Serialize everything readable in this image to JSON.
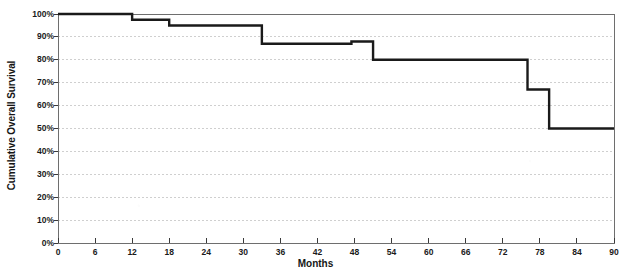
{
  "chart_data": {
    "type": "line",
    "subtype": "kaplan-meier-step",
    "title": "",
    "xlabel": "Months",
    "ylabel": "Cumulative Overall Survival",
    "xlim": [
      0,
      90
    ],
    "ylim": [
      0,
      100
    ],
    "xticks": [
      0,
      6,
      12,
      18,
      24,
      30,
      36,
      42,
      48,
      54,
      60,
      66,
      72,
      78,
      84,
      90
    ],
    "xtick_labels": [
      "0",
      "6",
      "12",
      "18",
      "24",
      "30",
      "36",
      "42",
      "48",
      "54",
      "60",
      "66",
      "72",
      "78",
      "84",
      "90"
    ],
    "yticks": [
      0,
      10,
      20,
      30,
      40,
      50,
      60,
      70,
      80,
      90,
      100
    ],
    "ytick_labels": [
      "0%",
      "10%",
      "20%",
      "30%",
      "40%",
      "50%",
      "60%",
      "70%",
      "80%",
      "90%",
      "100%"
    ],
    "grid": true,
    "grid_style": "dotted-horizontal",
    "legend": "none",
    "line_color": "#1a1a1a",
    "line_width": 2.4,
    "series": [
      {
        "name": "Cumulative Overall Survival",
        "step": "post",
        "x": [
          0,
          12,
          12,
          18,
          18,
          33,
          33,
          47.5,
          47.5,
          51,
          51,
          76,
          76,
          79.5,
          79.5,
          90
        ],
        "y": [
          100,
          100,
          97.5,
          97.5,
          95,
          95,
          87,
          87,
          88,
          88,
          80,
          80,
          67,
          67,
          50,
          50
        ],
        "points": [
          {
            "months": 0,
            "survival": 100
          },
          {
            "months": 12,
            "survival": 97.5
          },
          {
            "months": 18,
            "survival": 95
          },
          {
            "months": 33,
            "survival": 87
          },
          {
            "months": 47.5,
            "survival": 88
          },
          {
            "months": 51,
            "survival": 80
          },
          {
            "months": 76,
            "survival": 67
          },
          {
            "months": 79.5,
            "survival": 50
          },
          {
            "months": 90,
            "survival": 50
          }
        ]
      }
    ]
  },
  "axes": {
    "y_title": "Cumulative Overall Survival",
    "x_title": "Months"
  },
  "colors": {
    "curve": "#1a1a1a",
    "axis": "#6e6e6e",
    "grid": "#cfcfcf",
    "text": "#1a1a1a",
    "background": "#ffffff"
  }
}
